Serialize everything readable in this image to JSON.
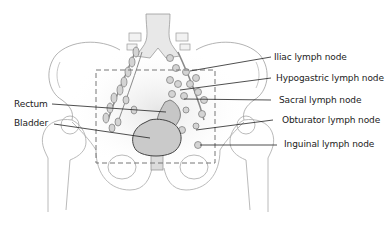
{
  "diagram": {
    "colors": {
      "outline": "#9a9a9a",
      "leader_line": "#222222",
      "dashed_box": "#777777",
      "organ_fill": "#cfcfcf",
      "spine_fill": "#e4e4e4",
      "text": "#222222"
    },
    "labels_left": [
      {
        "id": "rectum",
        "text": "Rectum"
      },
      {
        "id": "bladder",
        "text": "Bladder"
      }
    ],
    "labels_right": [
      {
        "id": "iliac",
        "text": "Iliac lymph node"
      },
      {
        "id": "hypogastric",
        "text": "Hypogastric lymph node"
      },
      {
        "id": "sacral",
        "text": "Sacral lymph node"
      },
      {
        "id": "obturator",
        "text": "Obturator lymph node"
      },
      {
        "id": "inguinal",
        "text": "Inguinal lymph node"
      }
    ]
  }
}
